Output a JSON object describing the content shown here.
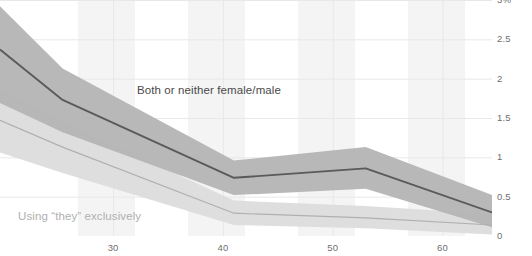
{
  "chart_data": {
    "type": "line",
    "title": "",
    "xlabel": "",
    "ylabel": "",
    "xlim": [
      19.7,
      64.5
    ],
    "ylim": [
      0,
      3
    ],
    "grid": true,
    "legend_position": "inline-annotation",
    "x_ticks": [
      30,
      40,
      50,
      60
    ],
    "x_tick_labels": [
      "30",
      "40",
      "50",
      "60"
    ],
    "y_ticks": [
      3,
      2.5,
      2,
      1.5,
      1,
      0.5,
      0
    ],
    "y_tick_labels": [
      "3%",
      "2.5",
      "2",
      "1.5",
      "1",
      "0.5",
      "0"
    ],
    "series": [
      {
        "name": "Both or neither female/male",
        "color": "#5a5a5a",
        "band_color": "#b4b4b4",
        "x": [
          19.7,
          25.4,
          41.0,
          53.0,
          64.5
        ],
        "values": [
          2.37,
          1.73,
          0.74,
          0.86,
          0.3
        ],
        "band_upper": [
          2.92,
          2.13,
          0.96,
          1.13,
          0.52
        ],
        "band_lower": [
          1.69,
          1.32,
          0.52,
          0.6,
          0.11
        ]
      },
      {
        "name": "Using \"they\" exclusively",
        "color": "#b0b0b0",
        "band_color": "#dcdcdc",
        "x": [
          19.7,
          25.4,
          41.0,
          53.0,
          64.5
        ],
        "values": [
          1.47,
          1.13,
          0.29,
          0.23,
          0.14
        ],
        "band_upper": [
          1.86,
          1.46,
          0.45,
          0.38,
          0.28
        ],
        "band_lower": [
          1.06,
          0.8,
          0.14,
          0.1,
          0.02
        ]
      }
    ]
  },
  "annotations": {
    "both_label": "Both or neither female/male",
    "they_label": "Using “they” exclusively"
  },
  "clipped_title": "survey respondents by age",
  "colors": {
    "dark_line": "#5a5a5a",
    "dark_band": "#b4b4b4",
    "light_line": "#b0b0b0",
    "light_band": "#dcdcdc",
    "gridline": "#e8e8e8",
    "tick_text": "#6f6f6f",
    "background": "#ffffff"
  }
}
